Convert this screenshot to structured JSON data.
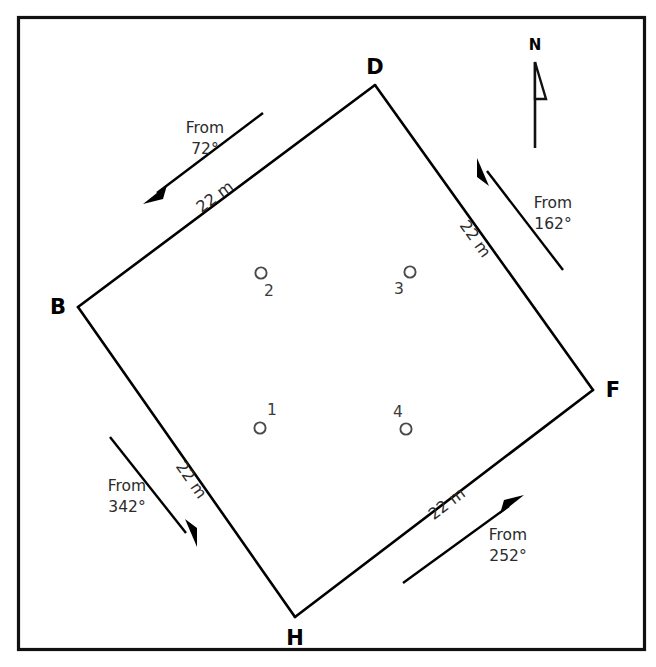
{
  "figure": {
    "background_color": "#ffffff",
    "line_color": "#000000",
    "frame_color": "#111111",
    "marker_color": "#4a4a4a"
  },
  "north_indicator": {
    "label": "N"
  },
  "plot": {
    "vertices": [
      {
        "id": "B",
        "label": "B",
        "x": 78,
        "y": 307,
        "label_x": 58,
        "label_y": 314
      },
      {
        "id": "D",
        "label": "D",
        "x": 375,
        "y": 85,
        "label_x": 375,
        "label_y": 74
      },
      {
        "id": "F",
        "label": "F",
        "x": 593,
        "y": 390,
        "label_x": 613,
        "label_y": 397
      },
      {
        "id": "H",
        "label": "H",
        "x": 295,
        "y": 617,
        "label_x": 295,
        "label_y": 645
      }
    ],
    "edges": [
      {
        "id": "BD",
        "length_label": "22 m",
        "from": "B",
        "to": "D"
      },
      {
        "id": "DF",
        "length_label": "22 m",
        "from": "D",
        "to": "F"
      },
      {
        "id": "FH",
        "length_label": "22 m",
        "from": "F",
        "to": "H"
      },
      {
        "id": "HB",
        "length_label": "22 m",
        "from": "H",
        "to": "B"
      }
    ]
  },
  "wind_arrows": [
    {
      "id": "from-72",
      "line1": "From",
      "line2": "72°",
      "bearing_degrees": 72,
      "label_x": 205,
      "label_y1": 133,
      "label_y2": 154
    },
    {
      "id": "from-162",
      "line1": "From",
      "line2": "162°",
      "bearing_degrees": 162,
      "label_x": 553,
      "label_y1": 208,
      "label_y2": 229
    },
    {
      "id": "from-252",
      "line1": "From",
      "line2": "252°",
      "bearing_degrees": 252,
      "label_x": 508,
      "label_y1": 540,
      "label_y2": 561
    },
    {
      "id": "from-342",
      "line1": "From",
      "line2": "342°",
      "bearing_degrees": 342,
      "label_x": 127,
      "label_y1": 491,
      "label_y2": 512
    }
  ],
  "sample_points": [
    {
      "id": "1",
      "label": "1",
      "cx": 260,
      "cy": 428,
      "label_x": 272,
      "label_y": 415
    },
    {
      "id": "2",
      "label": "2",
      "cx": 261,
      "cy": 273,
      "label_x": 269,
      "label_y": 296
    },
    {
      "id": "3",
      "label": "3",
      "cx": 410,
      "cy": 272,
      "label_x": 399,
      "label_y": 294
    },
    {
      "id": "4",
      "label": "4",
      "cx": 406,
      "cy": 429,
      "label_x": 398,
      "label_y": 417
    }
  ]
}
